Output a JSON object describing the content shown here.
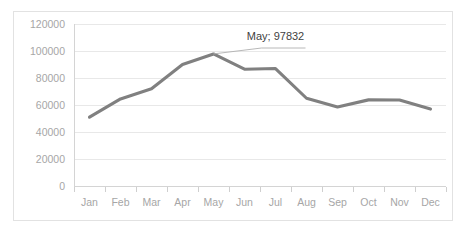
{
  "chart_data": {
    "type": "line",
    "title": "",
    "xlabel": "",
    "ylabel": "",
    "categories": [
      "Jan",
      "Feb",
      "Mar",
      "Apr",
      "May",
      "Jun",
      "Jul",
      "Aug",
      "Sep",
      "Oct",
      "Nov",
      "Dec"
    ],
    "values": [
      51000,
      64500,
      72000,
      90000,
      97832,
      86500,
      87000,
      65000,
      58500,
      63800,
      63700,
      57000
    ],
    "series": [
      {
        "name": "",
        "values": [
          51000,
          64500,
          72000,
          90000,
          97832,
          86500,
          87000,
          65000,
          58500,
          63800,
          63700,
          57000
        ]
      }
    ],
    "ylim": [
      0,
      120000
    ],
    "y_ticks": [
      0,
      20000,
      40000,
      60000,
      80000,
      100000,
      120000
    ],
    "y_tick_labels": [
      "0",
      "20000",
      "40000",
      "60000",
      "80000",
      "100000",
      "120000"
    ],
    "grid": true,
    "legend": false,
    "legend_position": "none",
    "annotations": [
      {
        "text": "May; 97832",
        "category": "May",
        "value": 97832
      }
    ],
    "colors": {
      "line": "#808080",
      "gridline": "#e8e8e8",
      "axis": "#d4d4d4",
      "tick_label": "#a6a6a6",
      "annotation_text": "#3f3f3f",
      "border": "#e2e2e2",
      "background": "#ffffff"
    }
  }
}
